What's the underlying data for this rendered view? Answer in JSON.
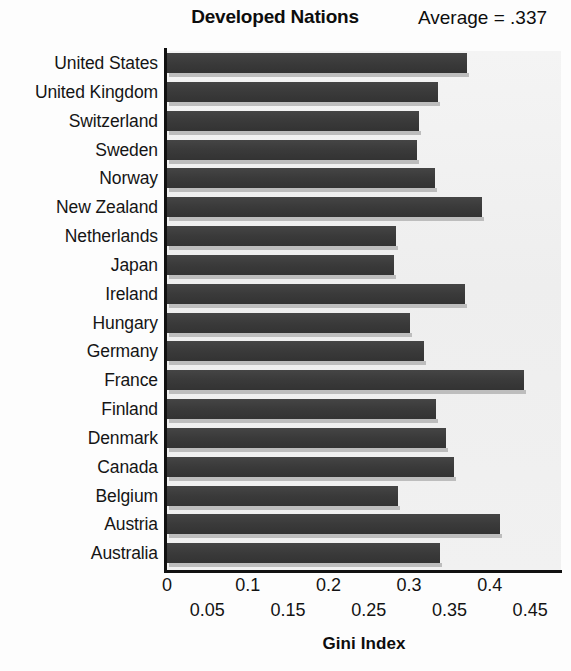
{
  "header": {
    "title": "Developed Nations",
    "average_note": "Average = .337"
  },
  "axis": {
    "title": "Gini Index",
    "major_ticks": [
      "0",
      "0.1",
      "0.2",
      "0.3",
      "0.4"
    ],
    "minor_ticks": [
      "0.05",
      "0.15",
      "0.25",
      "0.35",
      "0.45"
    ]
  },
  "chart_data": {
    "type": "bar",
    "orientation": "horizontal",
    "title": "Developed Nations",
    "annotation": "Average = .337",
    "xlabel": "Gini Index",
    "ylabel": "",
    "xlim": [
      0,
      0.47
    ],
    "grid": false,
    "legend": "none",
    "categories": [
      "United States",
      "United Kingdom",
      "Switzerland",
      "Sweden",
      "Norway",
      "New Zealand",
      "Netherlands",
      "Japan",
      "Ireland",
      "Hungary",
      "Germany",
      "France",
      "Finland",
      "Denmark",
      "Canada",
      "Belgium",
      "Austria",
      "Australia"
    ],
    "values": [
      0.372,
      0.336,
      0.312,
      0.31,
      0.332,
      0.39,
      0.284,
      0.281,
      0.369,
      0.301,
      0.319,
      0.442,
      0.333,
      0.346,
      0.356,
      0.286,
      0.413,
      0.338
    ],
    "x_major_tick_values": [
      0,
      0.1,
      0.2,
      0.3,
      0.4
    ],
    "x_minor_tick_values": [
      0.05,
      0.15,
      0.25,
      0.35,
      0.45
    ],
    "average": 0.337,
    "colors": {
      "bar": "#3b3b3b",
      "bar_shadow": "#bdbdbd",
      "plot_background": "#f0f0f0",
      "axis": "#111111",
      "text": "#131313"
    }
  }
}
